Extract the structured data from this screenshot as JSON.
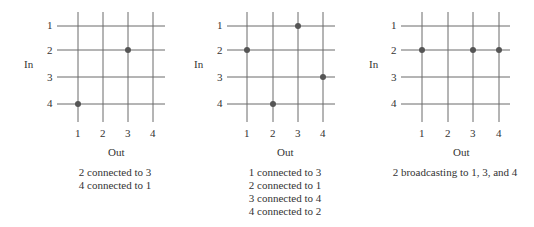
{
  "axis_labels": {
    "y": "In",
    "x": "Out"
  },
  "row_labels": [
    "1",
    "2",
    "3",
    "4"
  ],
  "col_labels": [
    "1",
    "2",
    "3",
    "4"
  ],
  "colors": {
    "grid": "#6b6b6b",
    "dot": "#555555",
    "text": "#333333"
  },
  "panels": [
    {
      "id": "panel-1",
      "connections": [
        {
          "in": 2,
          "out": 3
        },
        {
          "in": 4,
          "out": 1
        }
      ],
      "caption": [
        "2 connected to 3",
        "4 connected to 1"
      ]
    },
    {
      "id": "panel-2",
      "connections": [
        {
          "in": 1,
          "out": 3
        },
        {
          "in": 2,
          "out": 1
        },
        {
          "in": 3,
          "out": 4
        },
        {
          "in": 4,
          "out": 2
        }
      ],
      "caption": [
        "1 connected to 3",
        "2 connected to 1",
        "3 connected to 4",
        "4 connected to 2"
      ]
    },
    {
      "id": "panel-3",
      "connections": [
        {
          "in": 2,
          "out": 1
        },
        {
          "in": 2,
          "out": 3
        },
        {
          "in": 2,
          "out": 4
        }
      ],
      "caption": [
        "2 broadcasting to 1, 3, and 4"
      ]
    }
  ]
}
